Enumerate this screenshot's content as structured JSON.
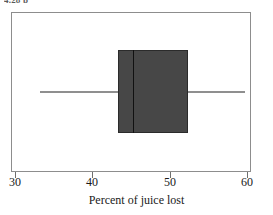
{
  "figure": {
    "caption_clipped": "4.28  b",
    "background_color": "#ffffff",
    "frame_color": "#8d8d8d"
  },
  "chart_data": {
    "type": "box",
    "title": "",
    "subtitle": "",
    "xlabel": "Percent of juice lost",
    "ylabel": "",
    "orientation": "horizontal",
    "grid": false,
    "legend": null,
    "xlim": [
      28.5,
      61.5
    ],
    "xticks": [
      30,
      40,
      50,
      60
    ],
    "xticklabels": [
      "30",
      "40",
      "50",
      "60"
    ],
    "series": [
      {
        "name": "Percent of juice lost",
        "min": 33.2,
        "q1": 43.3,
        "median": 45.2,
        "q3": 52.4,
        "max": 59.8,
        "outliers": []
      }
    ],
    "box_fill_color": "#474747",
    "box_edge_color": "#2b2b2b",
    "median_color": "#111111",
    "whisker_color": "#8f8f8f"
  }
}
